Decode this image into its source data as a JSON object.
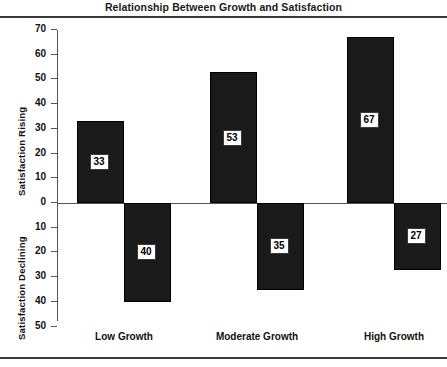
{
  "title": "Relationship Between Growth and Satisfaction",
  "axis_captions": {
    "upper": "Satisfaction Rising",
    "lower": "Satisfaction Declining"
  },
  "chart_data": {
    "type": "bar",
    "title": "Relationship Between Growth and Satisfaction",
    "xlabel": "",
    "ylabel": "Satisfaction Rising / Satisfaction Declining",
    "categories": [
      "Low Growth",
      "Moderate Growth",
      "High Growth"
    ],
    "series": [
      {
        "name": "Satisfaction Rising",
        "values": [
          33,
          53,
          67
        ]
      },
      {
        "name": "Satisfaction Declining",
        "values": [
          40,
          35,
          27
        ]
      }
    ],
    "ylim": [
      -50,
      70
    ],
    "yticks": [
      70,
      60,
      50,
      40,
      30,
      20,
      10,
      0,
      10,
      20,
      30,
      40,
      50
    ],
    "ytick_labels": [
      "70",
      "60",
      "50",
      "40",
      "30",
      "20",
      "10",
      "0",
      "10",
      "20",
      "30",
      "40",
      "50"
    ],
    "grid": false,
    "legend": "none",
    "bar_color": "#1a1a1a",
    "axis_color": "#555555",
    "label_box_color": "#ffffff"
  },
  "ticks": [
    {
      "label": "70",
      "value": 70
    },
    {
      "label": "60",
      "value": 60
    },
    {
      "label": "50",
      "value": 50
    },
    {
      "label": "40",
      "value": 40
    },
    {
      "label": "30",
      "value": 30
    },
    {
      "label": "20",
      "value": 20
    },
    {
      "label": "10",
      "value": 10
    },
    {
      "label": "0",
      "value": 0
    },
    {
      "label": "10",
      "value": -10
    },
    {
      "label": "20",
      "value": -20
    },
    {
      "label": "30",
      "value": -30
    },
    {
      "label": "40",
      "value": -40
    },
    {
      "label": "50",
      "value": -50
    }
  ],
  "bars": [
    {
      "group": "Low Growth",
      "series": "rising",
      "label": "33",
      "value": 33
    },
    {
      "group": "Low Growth",
      "series": "declining",
      "label": "40",
      "value": -40
    },
    {
      "group": "Moderate Growth",
      "series": "rising",
      "label": "53",
      "value": 53
    },
    {
      "group": "Moderate Growth",
      "series": "declining",
      "label": "35",
      "value": -35
    },
    {
      "group": "High Growth",
      "series": "rising",
      "label": "67",
      "value": 67
    },
    {
      "group": "High Growth",
      "series": "declining",
      "label": "27",
      "value": -27
    }
  ],
  "categories": [
    {
      "label": "Low Growth"
    },
    {
      "label": "Moderate Growth"
    },
    {
      "label": "High Growth"
    }
  ]
}
